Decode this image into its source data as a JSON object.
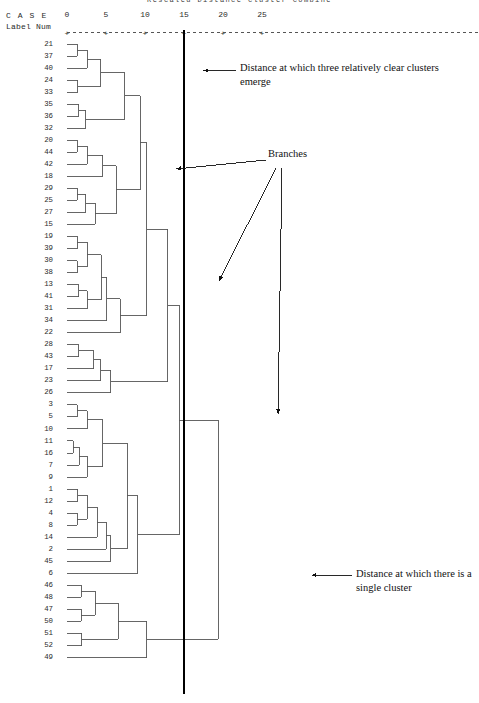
{
  "title": "Rescaled Distance Cluster Combine",
  "axis": {
    "header_line1": "C A S E",
    "header_line2": "Label  Num",
    "ticks": [
      {
        "value": 0,
        "label": "0"
      },
      {
        "value": 5,
        "label": "5"
      },
      {
        "value": 10,
        "label": "10"
      },
      {
        "value": 15,
        "label": "15"
      },
      {
        "value": 20,
        "label": "20"
      },
      {
        "value": 25,
        "label": "25"
      }
    ],
    "min": 0,
    "max": 27
  },
  "annotations": {
    "three_clusters": "Distance at which three relatively clear clusters emerge",
    "branches": "Branches",
    "single_cluster": "Distance at which there is a single cluster"
  },
  "colors": {
    "line": "#555555",
    "marker_line": "#000000",
    "text": "#222222",
    "background": "#ffffff"
  },
  "chart_data": {
    "type": "dendrogram",
    "title": "Rescaled Distance Cluster Combine",
    "xlabel": "Rescaled Distance Cluster Combine",
    "ylabel": "CASE Label Num",
    "xlim": [
      0,
      27
    ],
    "grid": false,
    "legend": "none",
    "case_labels": [
      "21",
      "37",
      "40",
      "24",
      "33",
      "35",
      "36",
      "32",
      "20",
      "44",
      "42",
      "18",
      "29",
      "25",
      "27",
      "15",
      "19",
      "39",
      "30",
      "38",
      "13",
      "41",
      "31",
      "34",
      "22",
      "28",
      "43",
      "17",
      "23",
      "26",
      "3",
      "5",
      "10",
      "11",
      "16",
      "7",
      "9",
      "1",
      "12",
      "4",
      "8",
      "14",
      "2",
      "45",
      "6",
      "46",
      "48",
      "47",
      "50",
      "51",
      "52",
      "49"
    ],
    "cut_lines": [
      {
        "name": "three-cluster-cut",
        "distance": 15,
        "style": "thick-vertical"
      }
    ],
    "merges": [
      {
        "id": "m1",
        "children": [
          "21",
          "37"
        ],
        "distance": 1.3
      },
      {
        "id": "m2",
        "children": [
          "m1",
          "40"
        ],
        "distance": 2.6
      },
      {
        "id": "m3",
        "children": [
          "24",
          "33"
        ],
        "distance": 1.4
      },
      {
        "id": "m4",
        "children": [
          "m2",
          "m3"
        ],
        "distance": 4.3
      },
      {
        "id": "m5",
        "children": [
          "35",
          "36"
        ],
        "distance": 1.5
      },
      {
        "id": "m6",
        "children": [
          "m5",
          "32"
        ],
        "distance": 2.4
      },
      {
        "id": "m7",
        "children": [
          "m4",
          "m6"
        ],
        "distance": 7.4
      },
      {
        "id": "m8",
        "children": [
          "20",
          "44"
        ],
        "distance": 1.3
      },
      {
        "id": "m9",
        "children": [
          "m8",
          "42"
        ],
        "distance": 2.6
      },
      {
        "id": "m10",
        "children": [
          "m9",
          "18"
        ],
        "distance": 4.6
      },
      {
        "id": "m11",
        "children": [
          "29",
          "25"
        ],
        "distance": 1.3
      },
      {
        "id": "m12",
        "children": [
          "m11",
          "27"
        ],
        "distance": 2.4
      },
      {
        "id": "m13",
        "children": [
          "m12",
          "15"
        ],
        "distance": 3.6
      },
      {
        "id": "m14",
        "children": [
          "m10",
          "m13"
        ],
        "distance": 6.3
      },
      {
        "id": "m15",
        "children": [
          "m7",
          "m14"
        ],
        "distance": 9.4
      },
      {
        "id": "m16",
        "children": [
          "19",
          "39"
        ],
        "distance": 1.3
      },
      {
        "id": "m17",
        "children": [
          "30",
          "38"
        ],
        "distance": 1.3
      },
      {
        "id": "m18",
        "children": [
          "m16",
          "m17"
        ],
        "distance": 2.6
      },
      {
        "id": "m19",
        "children": [
          "13",
          "41"
        ],
        "distance": 1.5
      },
      {
        "id": "m20",
        "children": [
          "m19",
          "31"
        ],
        "distance": 2.6
      },
      {
        "id": "m21",
        "children": [
          "m18",
          "m20"
        ],
        "distance": 4.4
      },
      {
        "id": "m22",
        "children": [
          "m21",
          "34"
        ],
        "distance": 5.1
      },
      {
        "id": "m23",
        "children": [
          "m22",
          "22"
        ],
        "distance": 6.8
      },
      {
        "id": "m24",
        "children": [
          "m15",
          "m23"
        ],
        "distance": 10.2
      },
      {
        "id": "m25",
        "children": [
          "28",
          "43"
        ],
        "distance": 1.5
      },
      {
        "id": "m26",
        "children": [
          "m25",
          "17"
        ],
        "distance": 3.4
      },
      {
        "id": "m27",
        "children": [
          "m26",
          "23"
        ],
        "distance": 4.3
      },
      {
        "id": "m28",
        "children": [
          "m27",
          "26"
        ],
        "distance": 5.6
      },
      {
        "id": "m29",
        "children": [
          "m24",
          "m28"
        ],
        "distance": 12.9
      },
      {
        "id": "m30",
        "children": [
          "3",
          "5"
        ],
        "distance": 1.3
      },
      {
        "id": "m31",
        "children": [
          "m30",
          "10"
        ],
        "distance": 2.6
      },
      {
        "id": "m32",
        "children": [
          "11",
          "16"
        ],
        "distance": 0.8
      },
      {
        "id": "m33",
        "children": [
          "m32",
          "7"
        ],
        "distance": 1.6
      },
      {
        "id": "m34",
        "children": [
          "m33",
          "9"
        ],
        "distance": 2.6
      },
      {
        "id": "m35",
        "children": [
          "m31",
          "m34"
        ],
        "distance": 4.6
      },
      {
        "id": "m36",
        "children": [
          "1",
          "12"
        ],
        "distance": 1.4
      },
      {
        "id": "m37",
        "children": [
          "4",
          "8"
        ],
        "distance": 1.3
      },
      {
        "id": "m38",
        "children": [
          "m36",
          "m37"
        ],
        "distance": 2.6
      },
      {
        "id": "m39",
        "children": [
          "m38",
          "14"
        ],
        "distance": 3.9
      },
      {
        "id": "m40",
        "children": [
          "m39",
          "2"
        ],
        "distance": 5.0
      },
      {
        "id": "m41",
        "children": [
          "m40",
          "45"
        ],
        "distance": 5.6
      },
      {
        "id": "m42",
        "children": [
          "m35",
          "m41"
        ],
        "distance": 7.7
      },
      {
        "id": "m43",
        "children": [
          "m42",
          "6"
        ],
        "distance": 9.1
      },
      {
        "id": "m44",
        "children": [
          "m29",
          "m43"
        ],
        "distance": 14.4
      },
      {
        "id": "m45",
        "children": [
          "46",
          "48"
        ],
        "distance": 1.8
      },
      {
        "id": "m46",
        "children": [
          "47",
          "50"
        ],
        "distance": 1.8
      },
      {
        "id": "m47",
        "children": [
          "m45",
          "m46"
        ],
        "distance": 3.6
      },
      {
        "id": "m48",
        "children": [
          "51",
          "52"
        ],
        "distance": 1.9
      },
      {
        "id": "m49",
        "children": [
          "m47",
          "m48"
        ],
        "distance": 6.6
      },
      {
        "id": "m50",
        "children": [
          "m49",
          "49"
        ],
        "distance": 10.2
      },
      {
        "id": "m51",
        "children": [
          "m44",
          "m50"
        ],
        "distance": 19.4
      }
    ]
  }
}
